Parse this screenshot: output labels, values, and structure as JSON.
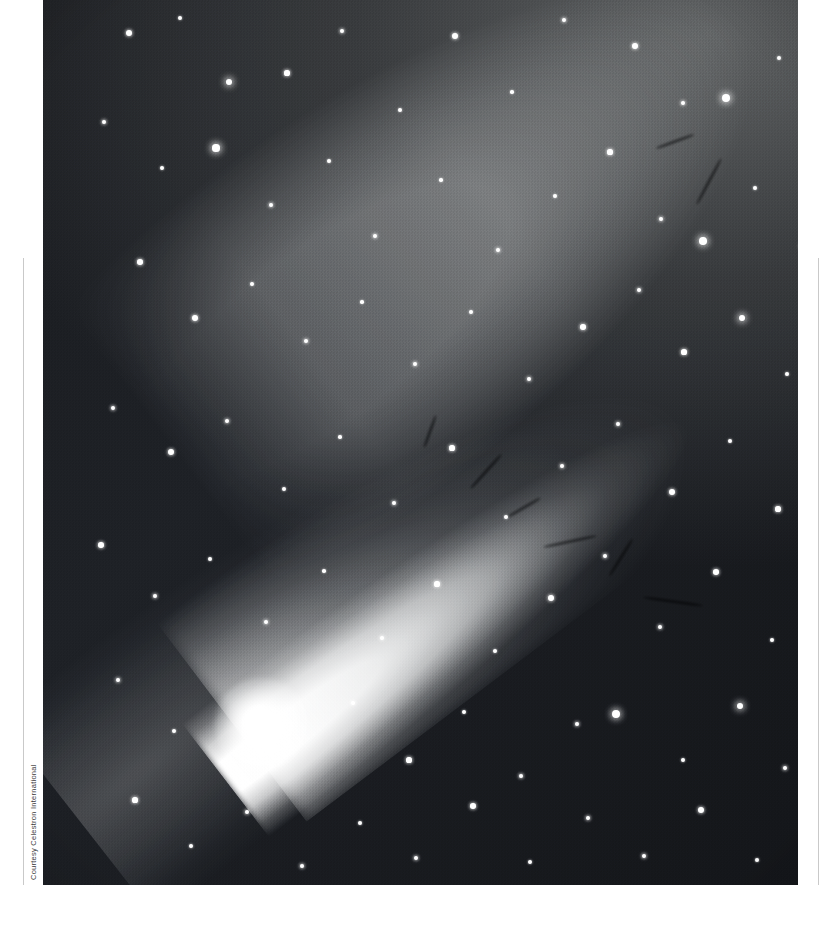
{
  "page": {
    "width": 840,
    "height": 934,
    "background": "#ffffff"
  },
  "photo": {
    "subject": "comet",
    "description": "Black-and-white astrophotograph of a bright comet with a broad dust tail and fainter ion tail against a dense star field",
    "frame": {
      "x": 43,
      "y": 0,
      "width": 755,
      "height": 885
    },
    "palette": {
      "sky_dark": "#1a1c20",
      "sky_light": "#8e9190",
      "tail_bright": "#ffffff",
      "coma": "#ffffff"
    },
    "features": {
      "coma_position": {
        "x": 218,
        "y": 724
      },
      "tail_direction": "upper-right",
      "tail_angle_deg": -37
    }
  },
  "credit": {
    "text": "Courtesy Celestron International",
    "orientation": "vertical",
    "color": "#3a3a3a"
  },
  "rules": {
    "color": "#c9c9c9",
    "left_x": 23,
    "right_x": 818,
    "top_y": 258,
    "bottom_y": 885
  },
  "stars": [
    {
      "x": 86,
      "y": 33,
      "r": 3.0
    },
    {
      "x": 137,
      "y": 18,
      "r": 2.0
    },
    {
      "x": 186,
      "y": 82,
      "r": 3.4
    },
    {
      "x": 244,
      "y": 73,
      "r": 2.6
    },
    {
      "x": 299,
      "y": 31,
      "r": 2.2
    },
    {
      "x": 357,
      "y": 110,
      "r": 2.0
    },
    {
      "x": 412,
      "y": 36,
      "r": 3.2
    },
    {
      "x": 469,
      "y": 92,
      "r": 1.8
    },
    {
      "x": 521,
      "y": 20,
      "r": 2.4
    },
    {
      "x": 592,
      "y": 46,
      "r": 3.0
    },
    {
      "x": 640,
      "y": 103,
      "r": 2.2
    },
    {
      "x": 683,
      "y": 98,
      "r": 4.4
    },
    {
      "x": 736,
      "y": 58,
      "r": 2.0
    },
    {
      "x": 771,
      "y": 140,
      "r": 2.6
    },
    {
      "x": 61,
      "y": 122,
      "r": 2.4
    },
    {
      "x": 119,
      "y": 168,
      "r": 2.0
    },
    {
      "x": 173,
      "y": 148,
      "r": 3.6
    },
    {
      "x": 228,
      "y": 205,
      "r": 2.2
    },
    {
      "x": 286,
      "y": 161,
      "r": 2.0
    },
    {
      "x": 332,
      "y": 236,
      "r": 2.4
    },
    {
      "x": 398,
      "y": 180,
      "r": 1.8
    },
    {
      "x": 455,
      "y": 250,
      "r": 2.2
    },
    {
      "x": 512,
      "y": 196,
      "r": 2.0
    },
    {
      "x": 567,
      "y": 152,
      "r": 2.6
    },
    {
      "x": 618,
      "y": 219,
      "r": 2.2
    },
    {
      "x": 660,
      "y": 241,
      "r": 3.8
    },
    {
      "x": 712,
      "y": 188,
      "r": 2.0
    },
    {
      "x": 760,
      "y": 246,
      "r": 2.8
    },
    {
      "x": 97,
      "y": 262,
      "r": 2.8
    },
    {
      "x": 152,
      "y": 318,
      "r": 3.2
    },
    {
      "x": 209,
      "y": 284,
      "r": 2.0
    },
    {
      "x": 263,
      "y": 341,
      "r": 2.4
    },
    {
      "x": 319,
      "y": 302,
      "r": 1.8
    },
    {
      "x": 372,
      "y": 364,
      "r": 2.2
    },
    {
      "x": 428,
      "y": 312,
      "r": 2.0
    },
    {
      "x": 486,
      "y": 379,
      "r": 2.4
    },
    {
      "x": 540,
      "y": 327,
      "r": 2.8
    },
    {
      "x": 596,
      "y": 290,
      "r": 2.2
    },
    {
      "x": 641,
      "y": 352,
      "r": 2.6
    },
    {
      "x": 699,
      "y": 318,
      "r": 3.4
    },
    {
      "x": 744,
      "y": 374,
      "r": 2.0
    },
    {
      "x": 779,
      "y": 300,
      "r": 2.4
    },
    {
      "x": 70,
      "y": 408,
      "r": 2.2
    },
    {
      "x": 128,
      "y": 452,
      "r": 3.0
    },
    {
      "x": 184,
      "y": 421,
      "r": 2.4
    },
    {
      "x": 241,
      "y": 489,
      "r": 2.0
    },
    {
      "x": 297,
      "y": 437,
      "r": 1.8
    },
    {
      "x": 351,
      "y": 503,
      "r": 2.2
    },
    {
      "x": 409,
      "y": 448,
      "r": 2.6
    },
    {
      "x": 463,
      "y": 517,
      "r": 2.0
    },
    {
      "x": 519,
      "y": 466,
      "r": 2.4
    },
    {
      "x": 575,
      "y": 424,
      "r": 2.2
    },
    {
      "x": 629,
      "y": 492,
      "r": 3.2
    },
    {
      "x": 687,
      "y": 441,
      "r": 2.0
    },
    {
      "x": 735,
      "y": 509,
      "r": 2.6
    },
    {
      "x": 782,
      "y": 460,
      "r": 2.2
    },
    {
      "x": 58,
      "y": 545,
      "r": 2.8
    },
    {
      "x": 112,
      "y": 596,
      "r": 2.2
    },
    {
      "x": 167,
      "y": 559,
      "r": 2.0
    },
    {
      "x": 223,
      "y": 622,
      "r": 2.4
    },
    {
      "x": 281,
      "y": 571,
      "r": 1.8
    },
    {
      "x": 339,
      "y": 638,
      "r": 2.2
    },
    {
      "x": 394,
      "y": 584,
      "r": 2.6
    },
    {
      "x": 452,
      "y": 651,
      "r": 2.0
    },
    {
      "x": 508,
      "y": 598,
      "r": 3.0
    },
    {
      "x": 562,
      "y": 556,
      "r": 2.4
    },
    {
      "x": 617,
      "y": 627,
      "r": 2.2
    },
    {
      "x": 673,
      "y": 572,
      "r": 2.8
    },
    {
      "x": 729,
      "y": 640,
      "r": 2.0
    },
    {
      "x": 776,
      "y": 590,
      "r": 2.4
    },
    {
      "x": 75,
      "y": 680,
      "r": 2.4
    },
    {
      "x": 131,
      "y": 731,
      "r": 2.0
    },
    {
      "x": 310,
      "y": 703,
      "r": 2.2
    },
    {
      "x": 366,
      "y": 760,
      "r": 2.6
    },
    {
      "x": 421,
      "y": 712,
      "r": 2.0
    },
    {
      "x": 478,
      "y": 776,
      "r": 2.4
    },
    {
      "x": 534,
      "y": 724,
      "r": 2.2
    },
    {
      "x": 573,
      "y": 714,
      "r": 4.2
    },
    {
      "x": 640,
      "y": 760,
      "r": 2.0
    },
    {
      "x": 697,
      "y": 706,
      "r": 3.4
    },
    {
      "x": 742,
      "y": 768,
      "r": 2.2
    },
    {
      "x": 787,
      "y": 716,
      "r": 2.0
    },
    {
      "x": 92,
      "y": 800,
      "r": 2.6
    },
    {
      "x": 148,
      "y": 846,
      "r": 2.0
    },
    {
      "x": 204,
      "y": 812,
      "r": 2.2
    },
    {
      "x": 259,
      "y": 866,
      "r": 2.4
    },
    {
      "x": 317,
      "y": 823,
      "r": 2.0
    },
    {
      "x": 373,
      "y": 858,
      "r": 2.2
    },
    {
      "x": 430,
      "y": 806,
      "r": 2.8
    },
    {
      "x": 487,
      "y": 862,
      "r": 2.0
    },
    {
      "x": 545,
      "y": 818,
      "r": 2.4
    },
    {
      "x": 601,
      "y": 856,
      "r": 2.2
    },
    {
      "x": 658,
      "y": 810,
      "r": 3.0
    },
    {
      "x": 714,
      "y": 860,
      "r": 2.0
    },
    {
      "x": 767,
      "y": 822,
      "r": 2.4
    },
    {
      "x": 246,
      "y": 742,
      "r": 2.0
    }
  ],
  "dark_streaks": [
    {
      "x": 420,
      "y": 470,
      "w": 46,
      "h": 3,
      "rot": -48
    },
    {
      "x": 462,
      "y": 506,
      "w": 38,
      "h": 3,
      "rot": -30
    },
    {
      "x": 500,
      "y": 540,
      "w": 54,
      "h": 3,
      "rot": -12
    },
    {
      "x": 556,
      "y": 556,
      "w": 44,
      "h": 3,
      "rot": -58
    },
    {
      "x": 600,
      "y": 600,
      "w": 60,
      "h": 3,
      "rot": 8
    },
    {
      "x": 640,
      "y": 180,
      "w": 52,
      "h": 3,
      "rot": -62
    },
    {
      "x": 612,
      "y": 140,
      "w": 40,
      "h": 3,
      "rot": -20
    },
    {
      "x": 370,
      "y": 430,
      "w": 34,
      "h": 3,
      "rot": -70
    }
  ]
}
